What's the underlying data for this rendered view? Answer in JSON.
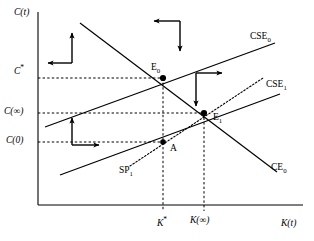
{
  "figure": {
    "type": "phase-diagram"
  },
  "axes": {
    "y_label": "C(t)",
    "x_label": "K(t)",
    "y_ticks": [
      {
        "id": "c-star",
        "base": "C",
        "sup": "*",
        "y_px": 70
      },
      {
        "id": "c-infinity",
        "base": "C(∞)",
        "sup": "",
        "y_px": 113
      },
      {
        "id": "c-zero",
        "base": "C(0)",
        "sup": "",
        "y_px": 142
      }
    ],
    "x_ticks": [
      {
        "id": "k-star",
        "base": "K",
        "sup": "*",
        "x_px": 163
      },
      {
        "id": "k-infinity",
        "base": "K(∞)",
        "sup": "",
        "x_px": 204
      }
    ]
  },
  "curves": [
    {
      "id": "cse0",
      "label_base": "CSE",
      "label_sub": "0",
      "style": "solid",
      "slope": "upward",
      "note": "Capital stock equilibrium locus, initial"
    },
    {
      "id": "cse1",
      "label_base": "CSE",
      "label_sub": "1",
      "style": "solid",
      "slope": "upward",
      "note": "Capital stock equilibrium locus, shifted"
    },
    {
      "id": "ce0",
      "label_base": "CE",
      "label_sub": "0",
      "style": "solid",
      "slope": "downward",
      "note": "Consumption equilibrium locus"
    },
    {
      "id": "sp1",
      "label_base": "SP",
      "label_sub": "1",
      "style": "dotted",
      "slope": "upward-steep",
      "note": "Saddle path"
    }
  ],
  "points": [
    {
      "id": "e0",
      "base": "E",
      "sub": "0",
      "x_px": 163,
      "y_px": 78
    },
    {
      "id": "e1",
      "base": "E",
      "sub": "1",
      "x_px": 204,
      "y_px": 113
    },
    {
      "id": "a",
      "base": "A",
      "sub": "",
      "x_px": 163,
      "y_px": 142
    }
  ],
  "arrow_groups": [
    {
      "id": "upper-left",
      "directions": "up-left"
    },
    {
      "id": "top-middle",
      "directions": "left-down"
    },
    {
      "id": "middle-right",
      "directions": "right-down"
    },
    {
      "id": "lower-left",
      "directions": "up-right"
    }
  ],
  "colors": {
    "stroke": "#000000",
    "background": "#ffffff"
  }
}
